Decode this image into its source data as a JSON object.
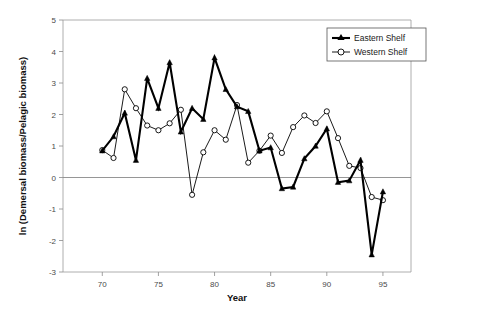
{
  "chart_data": {
    "type": "line",
    "title": "",
    "xlabel": "Year",
    "ylabel": "ln (Demersal biomass/Pelagic biomass)",
    "xlim": [
      66.5,
      97.5
    ],
    "ylim": [
      -3,
      5
    ],
    "xticks": [
      70,
      75,
      80,
      85,
      90,
      95
    ],
    "xtick_labels": [
      "70",
      "75",
      "80",
      "85",
      "90",
      "95"
    ],
    "yticks": [
      -3,
      -2,
      -1,
      0,
      1,
      2,
      3,
      4,
      5
    ],
    "ytick_labels": [
      "-3",
      "-2",
      "-1",
      "0",
      "1",
      "2",
      "3",
      "4",
      "5"
    ],
    "grid": false,
    "zero_line": true,
    "legend_position": "top-right",
    "x": [
      70,
      71,
      72,
      73,
      74,
      75,
      76,
      77,
      78,
      79,
      80,
      81,
      82,
      83,
      84,
      85,
      86,
      87,
      88,
      89,
      90,
      91,
      92,
      93,
      94,
      95
    ],
    "series": [
      {
        "name": "Eastern Shelf",
        "marker": "filled-triangle",
        "values": [
          0.85,
          1.3,
          2.05,
          0.55,
          3.15,
          2.2,
          3.65,
          1.45,
          2.2,
          1.85,
          3.8,
          2.8,
          2.25,
          2.1,
          0.85,
          0.95,
          -0.35,
          -0.3,
          0.6,
          1.0,
          1.55,
          -0.15,
          -0.1,
          0.55,
          -2.45,
          -0.45
        ]
      },
      {
        "name": "Western Shelf",
        "marker": "open-circle",
        "values": [
          0.87,
          0.62,
          2.8,
          2.2,
          1.65,
          1.5,
          1.72,
          2.15,
          -0.55,
          0.8,
          1.5,
          1.2,
          2.3,
          0.47,
          0.85,
          1.33,
          0.78,
          1.6,
          1.97,
          1.73,
          2.1,
          1.25,
          0.37,
          0.3,
          -0.62,
          -0.72
        ]
      }
    ]
  },
  "axes": {
    "x_title": "Year",
    "y_title": "ln (Demersal biomass/Pelagic biomass)"
  },
  "legend": {
    "entries": [
      {
        "label": "Eastern Shelf",
        "marker": "filled-triangle"
      },
      {
        "label": "Western Shelf",
        "marker": "open-circle"
      }
    ]
  },
  "colors": {
    "series_stroke": "#000000",
    "frame": "#9a9a9a",
    "zero_line": "#8a8a8a",
    "background": "#ffffff"
  }
}
